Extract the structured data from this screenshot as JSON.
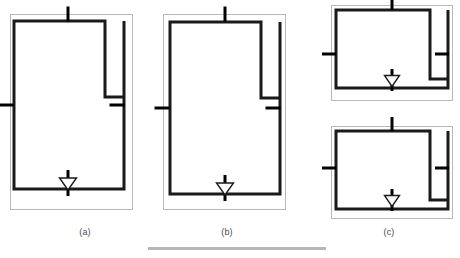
{
  "figure": {
    "kind": "line-drawing",
    "background_color": "#ffffff",
    "outer_boundary_color": "#b9b9b9",
    "wall_color": "#1a1a1a",
    "tick_color": "#000000",
    "footer_rule_color": "#b6b6b6",
    "outer_boundary_width": 1,
    "wall_width": 3,
    "tick_width": 3,
    "panels": [
      {
        "id": "a",
        "caption": "(a)",
        "shape": "portrait",
        "outer": {
          "x": 10,
          "y": 14,
          "w": 122,
          "h": 195
        },
        "wall": {
          "x": 14,
          "y": 21,
          "w": 110,
          "h": 168
        },
        "alcove": {
          "x": 105,
          "y": 21,
          "w": 19,
          "h": 76
        },
        "ticks": [
          {
            "name": "top-opening",
            "orientation": "vertical",
            "x": 68,
            "y": 14,
            "length": 15
          },
          {
            "name": "left-opening",
            "orientation": "horizontal",
            "x": 6,
            "y": 105,
            "length": 15
          },
          {
            "name": "right-opening",
            "orientation": "horizontal",
            "x": 117,
            "y": 105,
            "length": 15
          },
          {
            "name": "bottom-stem",
            "orientation": "vertical",
            "x": 68,
            "y": 183,
            "length": 26
          }
        ],
        "valve": {
          "name": "triangle-marker",
          "cx": 68,
          "cy": 184,
          "w": 17,
          "h": 12
        }
      },
      {
        "id": "b",
        "caption": "(b)",
        "shape": "portrait",
        "outer": {
          "x": 163,
          "y": 14,
          "w": 122,
          "h": 195
        },
        "wall": {
          "x": 170,
          "y": 22,
          "w": 110,
          "h": 172
        },
        "alcove": {
          "x": 261,
          "y": 22,
          "w": 19,
          "h": 76
        },
        "ticks": [
          {
            "name": "top-opening",
            "orientation": "vertical",
            "x": 225,
            "y": 14,
            "length": 15
          },
          {
            "name": "left-opening",
            "orientation": "horizontal",
            "x": 162,
            "y": 108,
            "length": 15
          },
          {
            "name": "right-opening",
            "orientation": "horizontal",
            "x": 273,
            "y": 108,
            "length": 15
          },
          {
            "name": "bottom-stem",
            "orientation": "vertical",
            "x": 225,
            "y": 188,
            "length": 26
          }
        ],
        "valve": {
          "name": "triangle-marker",
          "cx": 225,
          "cy": 189,
          "w": 17,
          "h": 12
        }
      },
      {
        "id": "c-top",
        "caption": "",
        "shape": "landscape",
        "outer": {
          "x": 331,
          "y": 5,
          "w": 121,
          "h": 95
        },
        "wall": {
          "x": 336,
          "y": 10,
          "w": 112,
          "h": 78
        },
        "alcove": {
          "x": 430,
          "y": 10,
          "w": 18,
          "h": 69
        },
        "ticks": [
          {
            "name": "top-opening",
            "orientation": "vertical",
            "x": 392,
            "y": 3,
            "length": 14
          },
          {
            "name": "left-opening",
            "orientation": "horizontal",
            "x": 329,
            "y": 54,
            "length": 14
          },
          {
            "name": "right-opening",
            "orientation": "horizontal",
            "x": 442,
            "y": 54,
            "length": 14
          },
          {
            "name": "bottom-stem",
            "orientation": "vertical",
            "x": 392,
            "y": 80,
            "length": 22
          }
        ],
        "valve": {
          "name": "triangle-marker",
          "cx": 392,
          "cy": 81,
          "w": 15,
          "h": 11
        }
      },
      {
        "id": "c-bottom",
        "caption": "(c)",
        "shape": "landscape",
        "outer": {
          "x": 331,
          "y": 126,
          "w": 121,
          "h": 92
        },
        "wall": {
          "x": 336,
          "y": 131,
          "w": 112,
          "h": 78
        },
        "alcove": {
          "x": 430,
          "y": 131,
          "w": 18,
          "h": 69
        },
        "ticks": [
          {
            "name": "top-opening",
            "orientation": "vertical",
            "x": 392,
            "y": 124,
            "length": 14
          },
          {
            "name": "left-opening",
            "orientation": "horizontal",
            "x": 329,
            "y": 168,
            "length": 14
          },
          {
            "name": "right-opening",
            "orientation": "horizontal",
            "x": 442,
            "y": 168,
            "length": 14
          },
          {
            "name": "bottom-stem",
            "orientation": "vertical",
            "x": 392,
            "y": 200,
            "length": 22
          }
        ],
        "valve": {
          "name": "triangle-marker",
          "cx": 392,
          "cy": 201,
          "w": 15,
          "h": 11
        }
      }
    ],
    "captions": {
      "a": "(a)",
      "b": "(b)",
      "c": "(c)"
    },
    "footer_rule": {
      "x": 148,
      "y": 247,
      "w": 178,
      "h": 3
    }
  }
}
